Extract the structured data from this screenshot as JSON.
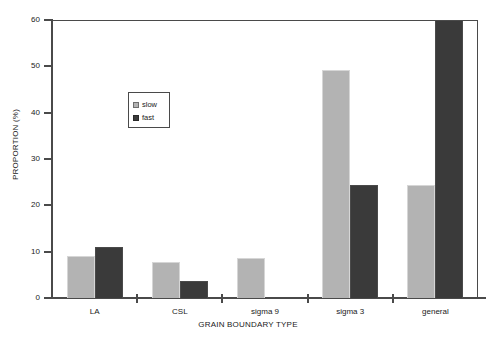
{
  "chart_data": {
    "type": "bar",
    "title": "",
    "xlabel": "GRAIN BOUNDARY TYPE",
    "ylabel": "PROPORTION (%)",
    "categories": [
      "LA",
      "CSL",
      "sigma 9",
      "sigma 3",
      "general"
    ],
    "series": [
      {
        "name": "slow",
        "color": "#b3b3b3",
        "values": [
          9.0,
          7.7,
          8.7,
          49.3,
          24.3
        ]
      },
      {
        "name": "fast",
        "color": "#3a3a3a",
        "values": [
          11.0,
          3.6,
          0,
          24.4,
          60.0
        ]
      }
    ],
    "ylim": [
      0,
      60
    ],
    "yticks": [
      0,
      10,
      20,
      30,
      40,
      50,
      60
    ],
    "ytick_labels": [
      "0",
      "10",
      "20",
      "30",
      "40",
      "50",
      "60"
    ],
    "grid": false,
    "legend_position": "upper-left-inside"
  },
  "legend": {
    "entries": [
      {
        "label": "slow"
      },
      {
        "label": "fast"
      }
    ]
  }
}
